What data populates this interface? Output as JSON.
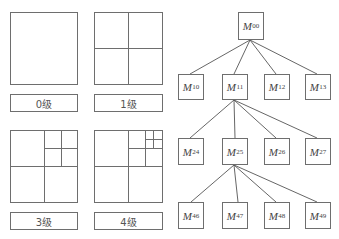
{
  "quadtree_levels": [
    {
      "label": "0级"
    },
    {
      "label": "1级"
    },
    {
      "label": "3级"
    },
    {
      "label": "4级"
    }
  ],
  "tree": {
    "root": {
      "name": "M",
      "sub": "00"
    },
    "level1": [
      {
        "name": "M",
        "sub": "10"
      },
      {
        "name": "M",
        "sub": "11"
      },
      {
        "name": "M",
        "sub": "12"
      },
      {
        "name": "M",
        "sub": "13"
      }
    ],
    "level2": [
      {
        "name": "M",
        "sub": "24"
      },
      {
        "name": "M",
        "sub": "25"
      },
      {
        "name": "M",
        "sub": "26"
      },
      {
        "name": "M",
        "sub": "27"
      }
    ],
    "level3": [
      {
        "name": "M",
        "sub": "46"
      },
      {
        "name": "M",
        "sub": "47"
      },
      {
        "name": "M",
        "sub": "48"
      },
      {
        "name": "M",
        "sub": "49"
      }
    ]
  },
  "colors": {
    "stroke": "#6e6e6e",
    "background": "#ffffff",
    "text": "#444444"
  }
}
